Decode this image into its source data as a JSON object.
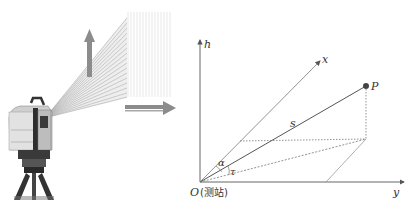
{
  "diagram": {
    "labels": {
      "h_axis": "h",
      "x_axis": "x",
      "y_axis": "y",
      "point": "P",
      "distance": "s",
      "angle_alpha": "α",
      "angle_tau": "τ",
      "origin": "O",
      "origin_note": "(测站)"
    },
    "colors": {
      "axis": "#555555",
      "beam": "#888888",
      "arrow": "#8a8a8a",
      "point": "#444444",
      "dotted": "#777777"
    }
  }
}
